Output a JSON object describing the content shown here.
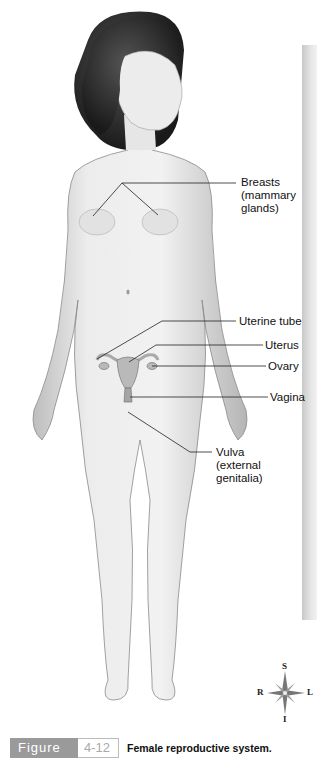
{
  "figure": {
    "word": "Figure",
    "number": "4-12",
    "title": "Female reproductive system."
  },
  "labels": [
    {
      "id": "breasts",
      "text": "Breasts\n(mammary\nglands)"
    },
    {
      "id": "uterine-tube",
      "text": "Uterine tube"
    },
    {
      "id": "uterus",
      "text": "Uterus"
    },
    {
      "id": "ovary",
      "text": "Ovary"
    },
    {
      "id": "vagina",
      "text": "Vagina"
    },
    {
      "id": "vulva",
      "text": "Vulva\n(external\ngenitalia)"
    }
  ],
  "compass": {
    "superior": "S",
    "inferior": "I",
    "right": "R",
    "left": "L"
  },
  "colors": {
    "caption_gray": "#9a9a9a",
    "skin": "#e4e4e4",
    "hair": "#2a2a2a",
    "organs": "#b9b9b9"
  }
}
